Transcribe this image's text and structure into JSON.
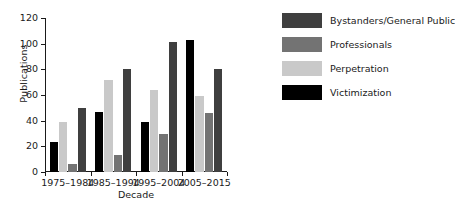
{
  "chart_data": {
    "type": "bar",
    "title": "",
    "xlabel": "Decade",
    "ylabel": "Publications",
    "categories": [
      "1975–1984",
      "1985–1994",
      "1995–2004",
      "2005–2015"
    ],
    "series": [
      {
        "name": "Bystanders/General Public",
        "color": "#3f3f3f",
        "values": [
          50,
          80,
          101,
          80
        ]
      },
      {
        "name": "Professionals",
        "color": "#737373",
        "values": [
          6,
          13,
          30,
          46
        ]
      },
      {
        "name": "Perpetration",
        "color": "#c9c9c9",
        "values": [
          39,
          72,
          64,
          59
        ]
      },
      {
        "name": "Victimization",
        "color": "#000000",
        "values": [
          23,
          47,
          39,
          103
        ]
      }
    ],
    "bar_draw_order": [
      "Victimization",
      "Perpetration",
      "Professionals",
      "Bystanders/General Public"
    ],
    "ylim": [
      0,
      120
    ],
    "yticks": [
      0,
      20,
      40,
      60,
      80,
      100,
      120
    ],
    "grid": false,
    "legend_position": "right"
  },
  "legend": {
    "items": [
      {
        "label": "Bystanders/General Public",
        "color": "#3f3f3f"
      },
      {
        "label": "Professionals",
        "color": "#737373"
      },
      {
        "label": "Perpetration",
        "color": "#c9c9c9"
      },
      {
        "label": "Victimization",
        "color": "#000000"
      }
    ]
  }
}
